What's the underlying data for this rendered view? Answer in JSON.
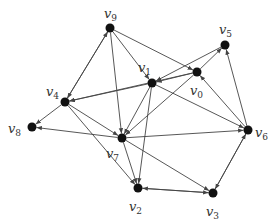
{
  "diagram": {
    "type": "directed-graph",
    "colors": {
      "edge": "#444444",
      "node": "#111111",
      "label": "#333333"
    },
    "nodes": [
      {
        "id": "v0",
        "label": "v",
        "sub": "0",
        "x": 197,
        "y": 72,
        "lx": 190,
        "ly": 95
      },
      {
        "id": "v1",
        "label": "v",
        "sub": "1",
        "x": 152,
        "y": 83,
        "lx": 138,
        "ly": 72
      },
      {
        "id": "v2",
        "label": "v",
        "sub": "2",
        "x": 138,
        "y": 188,
        "lx": 129,
        "ly": 211
      },
      {
        "id": "v3",
        "label": "v",
        "sub": "3",
        "x": 213,
        "y": 193,
        "lx": 206,
        "ly": 216
      },
      {
        "id": "v4",
        "label": "v",
        "sub": "4",
        "x": 65,
        "y": 102,
        "lx": 46,
        "ly": 96
      },
      {
        "id": "v5",
        "label": "v",
        "sub": "5",
        "x": 225,
        "y": 45,
        "lx": 219,
        "ly": 34
      },
      {
        "id": "v6",
        "label": "v",
        "sub": "6",
        "x": 248,
        "y": 130,
        "lx": 255,
        "ly": 137
      },
      {
        "id": "v7",
        "label": "v",
        "sub": "7",
        "x": 122,
        "y": 138,
        "lx": 106,
        "ly": 158
      },
      {
        "id": "v8",
        "label": "v",
        "sub": "8",
        "x": 32,
        "y": 127,
        "lx": 8,
        "ly": 133
      },
      {
        "id": "v9",
        "label": "v",
        "sub": "9",
        "x": 110,
        "y": 28,
        "lx": 104,
        "ly": 18
      }
    ],
    "edges": [
      [
        "v9",
        "v4"
      ],
      [
        "v4",
        "v9"
      ],
      [
        "v9",
        "v7"
      ],
      [
        "v9",
        "v0"
      ],
      [
        "v9",
        "v1"
      ],
      [
        "v0",
        "v4"
      ],
      [
        "v1",
        "v4"
      ],
      [
        "v5",
        "v1"
      ],
      [
        "v0",
        "v5"
      ],
      [
        "v6",
        "v5"
      ],
      [
        "v0",
        "v7"
      ],
      [
        "v1",
        "v7"
      ],
      [
        "v1",
        "v2"
      ],
      [
        "v6",
        "v0"
      ],
      [
        "v4",
        "v8"
      ],
      [
        "v7",
        "v8"
      ],
      [
        "v4",
        "v7"
      ],
      [
        "v4",
        "v2"
      ],
      [
        "v7",
        "v2"
      ],
      [
        "v7",
        "v3"
      ],
      [
        "v1",
        "v6"
      ],
      [
        "v7",
        "v6"
      ],
      [
        "v2",
        "v3"
      ],
      [
        "v3",
        "v2"
      ],
      [
        "v3",
        "v6"
      ],
      [
        "v6",
        "v3"
      ],
      [
        "v0",
        "v1"
      ]
    ]
  }
}
